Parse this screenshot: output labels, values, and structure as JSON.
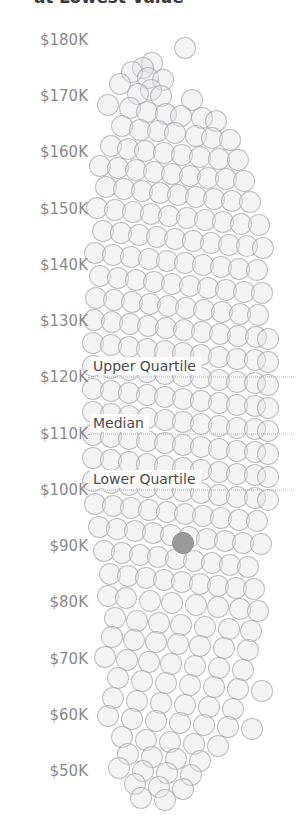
{
  "chart_data": {
    "type": "scatter",
    "title": "at Lowest Value",
    "xlabel": "",
    "ylabel": "",
    "ylim": [
      45000,
      185000
    ],
    "grid": false,
    "legend_position": "none",
    "tick_labels": [
      "$180K",
      "$170K",
      "$160K",
      "$150K",
      "$140K",
      "$130K",
      "$120K",
      "$110K",
      "$100K",
      "$90K",
      "$80K",
      "$70K",
      "$60K",
      "$50K"
    ],
    "tick_values": [
      180000,
      170000,
      160000,
      150000,
      140000,
      130000,
      120000,
      110000,
      100000,
      90000,
      80000,
      70000,
      60000,
      50000
    ],
    "annotations": [
      {
        "label": "Upper Quartile",
        "value": 120000
      },
      {
        "label": "Median",
        "value": 110000
      },
      {
        "label": "Lower Quartile",
        "value": 100000
      }
    ],
    "highlight": {
      "value": 90500,
      "x_slot": 12,
      "color": "#9a9a9a"
    },
    "colors": {
      "dot_fill": "#e1e1e4",
      "dot_stroke": "#96969b",
      "highlight": "#9a9a9a",
      "refline": "#b9b9b9",
      "tick_text": "#8a8a8a",
      "label_text": "#4a4a4a",
      "title_text": "#3b3b3b",
      "background": "#ffffff"
    },
    "points": [
      [
        185,
        48
      ],
      [
        152,
        63
      ],
      [
        143,
        68
      ],
      [
        132,
        72
      ],
      [
        148,
        78
      ],
      [
        163,
        80
      ],
      [
        120,
        84
      ],
      [
        151,
        90
      ],
      [
        138,
        94
      ],
      [
        161,
        96
      ],
      [
        192,
        100
      ],
      [
        108,
        105
      ],
      [
        130,
        108
      ],
      [
        147,
        112
      ],
      [
        166,
        114
      ],
      [
        181,
        116
      ],
      [
        202,
        118
      ],
      [
        216,
        121
      ],
      [
        122,
        126
      ],
      [
        140,
        130
      ],
      [
        158,
        131
      ],
      [
        175,
        133
      ],
      [
        196,
        136
      ],
      [
        212,
        138
      ],
      [
        230,
        140
      ],
      [
        111,
        146
      ],
      [
        128,
        149
      ],
      [
        145,
        151
      ],
      [
        164,
        153
      ],
      [
        182,
        155
      ],
      [
        200,
        157
      ],
      [
        219,
        159
      ],
      [
        238,
        160
      ],
      [
        100,
        166
      ],
      [
        118,
        168
      ],
      [
        136,
        170
      ],
      [
        154,
        172
      ],
      [
        172,
        174
      ],
      [
        190,
        176
      ],
      [
        208,
        178
      ],
      [
        226,
        179
      ],
      [
        244,
        181
      ],
      [
        106,
        187
      ],
      [
        124,
        189
      ],
      [
        142,
        191
      ],
      [
        160,
        193
      ],
      [
        178,
        195
      ],
      [
        196,
        197
      ],
      [
        214,
        199
      ],
      [
        232,
        201
      ],
      [
        250,
        202
      ],
      [
        97,
        208
      ],
      [
        115,
        210
      ],
      [
        133,
        212
      ],
      [
        151,
        214
      ],
      [
        169,
        216
      ],
      [
        187,
        218
      ],
      [
        205,
        220
      ],
      [
        223,
        222
      ],
      [
        241,
        224
      ],
      [
        259,
        225
      ],
      [
        103,
        231
      ],
      [
        121,
        233
      ],
      [
        139,
        235
      ],
      [
        157,
        237
      ],
      [
        175,
        239
      ],
      [
        193,
        241
      ],
      [
        211,
        243
      ],
      [
        229,
        245
      ],
      [
        247,
        246
      ],
      [
        263,
        248
      ],
      [
        95,
        253
      ],
      [
        113,
        255
      ],
      [
        131,
        257
      ],
      [
        149,
        259
      ],
      [
        167,
        261
      ],
      [
        185,
        263
      ],
      [
        203,
        265
      ],
      [
        221,
        267
      ],
      [
        239,
        269
      ],
      [
        257,
        270
      ],
      [
        100,
        276
      ],
      [
        118,
        278
      ],
      [
        136,
        280
      ],
      [
        154,
        282
      ],
      [
        172,
        284
      ],
      [
        190,
        286
      ],
      [
        208,
        288
      ],
      [
        226,
        290
      ],
      [
        244,
        292
      ],
      [
        262,
        293
      ],
      [
        96,
        298
      ],
      [
        114,
        300
      ],
      [
        132,
        302
      ],
      [
        150,
        304
      ],
      [
        168,
        306
      ],
      [
        186,
        308
      ],
      [
        204,
        310
      ],
      [
        222,
        312
      ],
      [
        240,
        314
      ],
      [
        258,
        315
      ],
      [
        94,
        320
      ],
      [
        112,
        322
      ],
      [
        130,
        324
      ],
      [
        148,
        326
      ],
      [
        166,
        328
      ],
      [
        184,
        330
      ],
      [
        202,
        332
      ],
      [
        220,
        334
      ],
      [
        238,
        336
      ],
      [
        256,
        337
      ],
      [
        268,
        339
      ],
      [
        93,
        343
      ],
      [
        111,
        345
      ],
      [
        129,
        347
      ],
      [
        147,
        349
      ],
      [
        165,
        351
      ],
      [
        183,
        353
      ],
      [
        201,
        355
      ],
      [
        219,
        357
      ],
      [
        237,
        359
      ],
      [
        255,
        360
      ],
      [
        268,
        362
      ],
      [
        93,
        366
      ],
      [
        111,
        368
      ],
      [
        129,
        370
      ],
      [
        147,
        372
      ],
      [
        165,
        374
      ],
      [
        183,
        376
      ],
      [
        201,
        378
      ],
      [
        219,
        380
      ],
      [
        237,
        382
      ],
      [
        255,
        383
      ],
      [
        268,
        385
      ],
      [
        93,
        389
      ],
      [
        111,
        391
      ],
      [
        129,
        393
      ],
      [
        147,
        395
      ],
      [
        165,
        397
      ],
      [
        183,
        399
      ],
      [
        201,
        401
      ],
      [
        219,
        403
      ],
      [
        237,
        405
      ],
      [
        255,
        406
      ],
      [
        268,
        408
      ],
      [
        93,
        412
      ],
      [
        111,
        414
      ],
      [
        129,
        416
      ],
      [
        147,
        418
      ],
      [
        165,
        420
      ],
      [
        183,
        422
      ],
      [
        201,
        424
      ],
      [
        219,
        426
      ],
      [
        237,
        428
      ],
      [
        255,
        429
      ],
      [
        268,
        431
      ],
      [
        93,
        435
      ],
      [
        111,
        437
      ],
      [
        129,
        439
      ],
      [
        147,
        441
      ],
      [
        165,
        443
      ],
      [
        183,
        445
      ],
      [
        201,
        447
      ],
      [
        219,
        449
      ],
      [
        237,
        451
      ],
      [
        255,
        452
      ],
      [
        268,
        454
      ],
      [
        93,
        458
      ],
      [
        111,
        460
      ],
      [
        129,
        462
      ],
      [
        147,
        464
      ],
      [
        165,
        466
      ],
      [
        183,
        468
      ],
      [
        201,
        470
      ],
      [
        219,
        472
      ],
      [
        237,
        474
      ],
      [
        255,
        475
      ],
      [
        268,
        477
      ],
      [
        93,
        481
      ],
      [
        111,
        483
      ],
      [
        129,
        485
      ],
      [
        147,
        487
      ],
      [
        165,
        489
      ],
      [
        183,
        491
      ],
      [
        201,
        493
      ],
      [
        219,
        495
      ],
      [
        237,
        497
      ],
      [
        255,
        498
      ],
      [
        268,
        500
      ],
      [
        95,
        504
      ],
      [
        113,
        506
      ],
      [
        131,
        508
      ],
      [
        149,
        510
      ],
      [
        167,
        512
      ],
      [
        185,
        514
      ],
      [
        203,
        516
      ],
      [
        221,
        518
      ],
      [
        239,
        520
      ],
      [
        257,
        521
      ],
      [
        99,
        527
      ],
      [
        117,
        529
      ],
      [
        135,
        531
      ],
      [
        153,
        533
      ],
      [
        171,
        535
      ],
      [
        189,
        537
      ],
      [
        207,
        539
      ],
      [
        225,
        541
      ],
      [
        243,
        543
      ],
      [
        261,
        544
      ],
      [
        104,
        551
      ],
      [
        122,
        553
      ],
      [
        140,
        555
      ],
      [
        158,
        557
      ],
      [
        176,
        559
      ],
      [
        194,
        561
      ],
      [
        212,
        563
      ],
      [
        230,
        565
      ],
      [
        248,
        567
      ],
      [
        110,
        574
      ],
      [
        128,
        576
      ],
      [
        146,
        578
      ],
      [
        164,
        580
      ],
      [
        182,
        582
      ],
      [
        200,
        584
      ],
      [
        218,
        586
      ],
      [
        236,
        588
      ],
      [
        254,
        589
      ],
      [
        108,
        596
      ],
      [
        126,
        598
      ],
      [
        150,
        601
      ],
      [
        172,
        603
      ],
      [
        196,
        605
      ],
      [
        218,
        607
      ],
      [
        240,
        609
      ],
      [
        258,
        611
      ],
      [
        115,
        618
      ],
      [
        137,
        621
      ],
      [
        159,
        623
      ],
      [
        181,
        625
      ],
      [
        205,
        627
      ],
      [
        229,
        629
      ],
      [
        251,
        631
      ],
      [
        112,
        637
      ],
      [
        134,
        640
      ],
      [
        156,
        642
      ],
      [
        178,
        644
      ],
      [
        200,
        646
      ],
      [
        224,
        648
      ],
      [
        248,
        650
      ],
      [
        105,
        657
      ],
      [
        127,
        660
      ],
      [
        149,
        662
      ],
      [
        171,
        664
      ],
      [
        195,
        666
      ],
      [
        219,
        668
      ],
      [
        243,
        670
      ],
      [
        118,
        678
      ],
      [
        142,
        681
      ],
      [
        166,
        683
      ],
      [
        190,
        685
      ],
      [
        214,
        687
      ],
      [
        238,
        689
      ],
      [
        262,
        691
      ],
      [
        113,
        698
      ],
      [
        137,
        701
      ],
      [
        161,
        703
      ],
      [
        185,
        705
      ],
      [
        209,
        707
      ],
      [
        233,
        709
      ],
      [
        108,
        716
      ],
      [
        132,
        719
      ],
      [
        156,
        721
      ],
      [
        180,
        723
      ],
      [
        204,
        725
      ],
      [
        228,
        727
      ],
      [
        252,
        729
      ],
      [
        122,
        737
      ],
      [
        146,
        740
      ],
      [
        170,
        742
      ],
      [
        194,
        744
      ],
      [
        218,
        746
      ],
      [
        128,
        754
      ],
      [
        152,
        757
      ],
      [
        176,
        759
      ],
      [
        200,
        761
      ],
      [
        119,
        768
      ],
      [
        143,
        771
      ],
      [
        167,
        773
      ],
      [
        191,
        775
      ],
      [
        135,
        784
      ],
      [
        159,
        787
      ],
      [
        183,
        789
      ],
      [
        141,
        798
      ],
      [
        165,
        800
      ]
    ]
  }
}
